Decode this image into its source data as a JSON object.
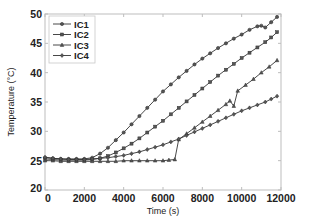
{
  "chart_data": {
    "type": "line",
    "title": "",
    "xlabel": "Time (s)",
    "ylabel": "Temperature (°C)",
    "xlim": [
      0,
      12000
    ],
    "ylim": [
      20,
      50
    ],
    "xticks": [
      0,
      2000,
      4000,
      6000,
      8000,
      10000,
      12000
    ],
    "yticks": [
      20,
      25,
      30,
      35,
      40,
      45,
      50
    ],
    "grid": false,
    "legend_position": "upper left",
    "series": [
      {
        "name": "IC1",
        "marker": "circle",
        "x": [
          0,
          400,
          800,
          1200,
          1600,
          2000,
          2400,
          2800,
          3200,
          3600,
          4000,
          4400,
          4800,
          5200,
          5600,
          6000,
          6400,
          6800,
          7200,
          7600,
          8000,
          8400,
          8800,
          9200,
          9600,
          10000,
          10400,
          10800,
          11000,
          11200,
          11500,
          11800
        ],
        "values": [
          25.5,
          25.4,
          25.3,
          25.3,
          25.3,
          25.3,
          25.5,
          26.2,
          27.2,
          28.5,
          29.8,
          31.2,
          32.6,
          34.0,
          35.4,
          36.8,
          38.0,
          39.2,
          40.3,
          41.4,
          42.4,
          43.3,
          44.2,
          45.0,
          45.8,
          46.5,
          47.3,
          47.9,
          48.0,
          47.7,
          48.6,
          49.5
        ]
      },
      {
        "name": "IC2",
        "marker": "square",
        "x": [
          0,
          400,
          800,
          1200,
          1600,
          2000,
          2400,
          2800,
          3200,
          3600,
          4000,
          4400,
          4800,
          5200,
          5600,
          6000,
          6400,
          6800,
          7200,
          7600,
          8000,
          8400,
          8800,
          9200,
          9600,
          10000,
          10400,
          10800,
          11200,
          11500,
          11800
        ],
        "values": [
          25.3,
          25.2,
          25.1,
          25.1,
          25.1,
          25.1,
          25.2,
          25.4,
          25.8,
          26.4,
          27.1,
          27.9,
          28.8,
          29.8,
          30.8,
          31.8,
          32.9,
          34.0,
          35.1,
          36.2,
          37.3,
          38.4,
          39.5,
          40.5,
          41.5,
          42.5,
          43.4,
          44.3,
          45.2,
          46.0,
          46.9
        ]
      },
      {
        "name": "IC3",
        "marker": "triangle",
        "x": [
          0,
          400,
          800,
          1200,
          1600,
          2000,
          2400,
          2800,
          3200,
          3600,
          4000,
          4400,
          4800,
          5200,
          5600,
          6000,
          6300,
          6600,
          6800,
          7200,
          7600,
          8000,
          8400,
          8800,
          9200,
          9400,
          9600,
          9800,
          10200,
          10600,
          11000,
          11400,
          11800
        ],
        "values": [
          25.0,
          25.0,
          24.9,
          24.9,
          24.9,
          24.9,
          24.9,
          24.9,
          24.9,
          24.9,
          25.0,
          25.0,
          25.0,
          25.0,
          25.0,
          25.0,
          25.1,
          25.2,
          28.6,
          29.6,
          30.6,
          31.6,
          32.6,
          33.6,
          34.6,
          35.2,
          34.3,
          36.9,
          37.9,
          38.9,
          40.0,
          41.0,
          42.1
        ]
      },
      {
        "name": "IC4",
        "marker": "diamond",
        "x": [
          0,
          400,
          800,
          1200,
          1600,
          2000,
          2400,
          2800,
          3200,
          3600,
          4000,
          4400,
          4800,
          5200,
          5600,
          6000,
          6400,
          6800,
          7200,
          7600,
          8000,
          8400,
          8800,
          9200,
          9600,
          10000,
          10400,
          10800,
          11200,
          11500,
          11800
        ],
        "values": [
          25.6,
          25.4,
          25.3,
          25.2,
          25.2,
          25.2,
          25.3,
          25.4,
          25.5,
          25.7,
          25.9,
          26.2,
          26.5,
          26.9,
          27.3,
          27.7,
          28.2,
          28.7,
          29.3,
          29.9,
          30.5,
          31.1,
          31.7,
          32.3,
          32.9,
          33.5,
          34.0,
          34.5,
          35.0,
          35.5,
          36.0
        ]
      }
    ]
  }
}
